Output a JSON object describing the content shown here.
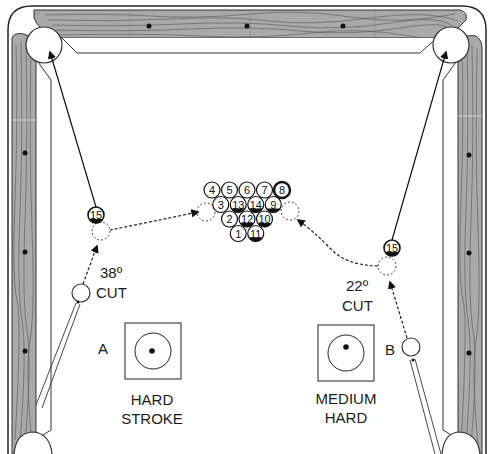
{
  "diagram": {
    "title": "",
    "table": {
      "rail_color": "#a9a9a9",
      "grain_color": "#555555",
      "diamond_color": "#111111",
      "cloth_color": "#ffffff"
    },
    "rack": {
      "rows": [
        [
          "4",
          "5",
          "6",
          "7",
          "8"
        ],
        [
          "3",
          "13",
          "14",
          "9"
        ],
        [
          "2",
          "12",
          "10"
        ],
        [
          "1",
          "11"
        ]
      ],
      "striped": [
        "8",
        "13",
        "14",
        "9",
        "12",
        "10",
        "11"
      ]
    },
    "shot_a": {
      "object_ball": "15",
      "cut_angle": "38º",
      "cut_label": "CUT",
      "cue_label": "A",
      "stroke_line1": "HARD",
      "stroke_line2": "STROKE"
    },
    "shot_b": {
      "object_ball": "15",
      "cut_angle": "22º",
      "cut_label": "CUT",
      "cue_label": "B",
      "stroke_line1": "MEDIUM",
      "stroke_line2": "HARD"
    }
  }
}
